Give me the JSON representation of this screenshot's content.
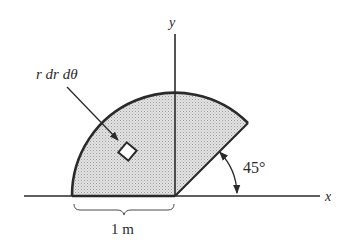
{
  "diagram": {
    "type": "polar-sector-area",
    "labels": {
      "element": "r dr dθ",
      "y_axis": "y",
      "x_axis": "x",
      "angle": "45°",
      "radius": "1 m"
    },
    "geometry": {
      "origin": [
        175,
        196
      ],
      "radius_px": 103,
      "theta_start_deg": 45,
      "theta_end_deg": 180,
      "angle_arc_radius_px": 62
    },
    "colors": {
      "ink": "#2a2a2a",
      "fill": "#d9d9d9",
      "background": "#ffffff"
    }
  }
}
